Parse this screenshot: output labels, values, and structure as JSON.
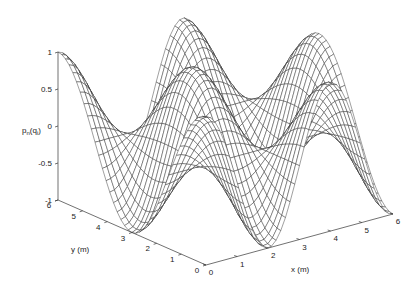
{
  "chart_data": {
    "type": "surface",
    "title": "",
    "xlabel": "x (m)",
    "ylabel": "y (m)",
    "zlabel": "p",
    "zlabel_sub": "n",
    "zlabel_arg": "q",
    "zlabel_arg_sub": "i",
    "xlim": [
      0,
      6
    ],
    "ylim": [
      0,
      6
    ],
    "zlim": [
      -1,
      1
    ],
    "x_ticks": [
      0,
      1,
      2,
      3,
      4,
      5,
      6
    ],
    "y_ticks": [
      0,
      1,
      2,
      3,
      4,
      5,
      6
    ],
    "z_ticks": [
      -1,
      -0.5,
      0,
      0.5,
      1
    ],
    "z_tick_labels": [
      "-1",
      "-0.5",
      "0",
      "0.5",
      "1"
    ],
    "grid": false,
    "mesh_resolution": 40,
    "surface_description": "Wireframe mesh surface of a 2D cosine-mode shape over 0..6 m x 0..6 m; value 1 at (x=0,y=6), minima near (x=0,y=3) and (x=2,y=0), peaks along the back edge.",
    "surface_model": {
      "kx": 0.5,
      "ky": 0.3333,
      "y_offset": 6
    },
    "sample_values": [
      {
        "x": 0,
        "y": 6,
        "z": 1
      },
      {
        "x": 0,
        "y": 3,
        "z": -1
      },
      {
        "x": 2,
        "y": 0,
        "z": -1
      },
      {
        "x": 2,
        "y": 6,
        "z": -1
      },
      {
        "x": 4,
        "y": 6,
        "z": 1
      },
      {
        "x": 6,
        "y": 0,
        "z": -1
      }
    ]
  },
  "projection": {
    "origin_px": [
      206,
      265
    ],
    "x_end_px": [
      393,
      214
    ],
    "y_end_px": [
      58,
      200
    ],
    "z_unit_px": 74
  }
}
